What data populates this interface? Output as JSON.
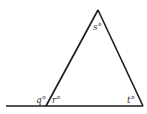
{
  "diagram": {
    "type": "triangle-exterior-angle",
    "labels": {
      "apex": "s°",
      "exterior_left": "q°",
      "interior_left": "r°",
      "interior_right": "t°"
    },
    "colors": {
      "stroke": "#1a1a1a",
      "background": "#ffffff"
    }
  }
}
